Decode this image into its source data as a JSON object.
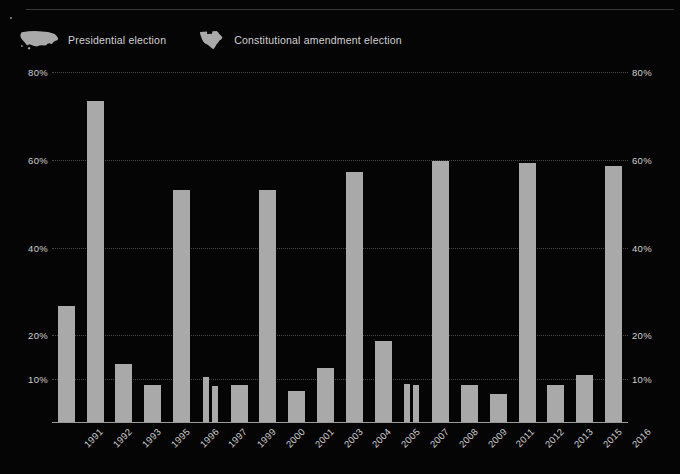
{
  "legend": {
    "items": [
      {
        "label": "Presidential election",
        "icon": "usa-map-icon",
        "color": "#a9a9a9"
      },
      {
        "label": "Constitutional amendment election",
        "icon": "texas-map-icon",
        "color": "#a9a9a9"
      }
    ]
  },
  "axis": {
    "y_ticks": [
      "80%",
      "60%",
      "40%",
      "20%",
      "10%"
    ],
    "y_tick_values": [
      80,
      60,
      40,
      20,
      10
    ],
    "y_axis_right_ticks": [
      "80%",
      "60%",
      "40%",
      "20%",
      "10%"
    ]
  },
  "colors": {
    "background": "#050505",
    "bar": "#a9a9a9",
    "gridline": "#4a4a4a",
    "baseline": "#9a9a9a",
    "text": "#cfcfcf",
    "rule": "#3a3a3a"
  },
  "chart_data": {
    "type": "bar",
    "title": "",
    "subtitle": "",
    "xlabel": "",
    "ylabel": "",
    "ylim": [
      0,
      80
    ],
    "grid": true,
    "legend_position": "top-left",
    "categories": [
      "1991",
      "1992",
      "1993",
      "1995",
      "1996",
      "1997",
      "1999",
      "2000",
      "2001",
      "2003",
      "2004",
      "2005",
      "2007",
      "2008",
      "2009",
      "2011",
      "2012",
      "2013",
      "2015",
      "2016"
    ],
    "bars": [
      {
        "category": "1991",
        "values": [
          26.6
        ],
        "type": "amendment"
      },
      {
        "category": "1992",
        "values": [
          73.4
        ],
        "type": "presidential"
      },
      {
        "category": "1993",
        "values": [
          13.4
        ],
        "type": "amendment"
      },
      {
        "category": "1995",
        "values": [
          8.6
        ],
        "type": "amendment"
      },
      {
        "category": "1996",
        "values": [
          53.0
        ],
        "type": "presidential"
      },
      {
        "category": "1997",
        "values": [
          10.5,
          8.5
        ],
        "type": "amendment"
      },
      {
        "category": "1999",
        "values": [
          8.6
        ],
        "type": "amendment"
      },
      {
        "category": "2000",
        "values": [
          53.0
        ],
        "type": "presidential"
      },
      {
        "category": "2001",
        "values": [
          7.3
        ],
        "type": "amendment"
      },
      {
        "category": "2003",
        "values": [
          12.5
        ],
        "type": "amendment"
      },
      {
        "category": "2004",
        "values": [
          57.2
        ],
        "type": "presidential"
      },
      {
        "category": "2005",
        "values": [
          18.7
        ],
        "type": "amendment"
      },
      {
        "category": "2007",
        "values": [
          8.9,
          8.6
        ],
        "type": "amendment"
      },
      {
        "category": "2008",
        "values": [
          59.8
        ],
        "type": "presidential"
      },
      {
        "category": "2009",
        "values": [
          8.6
        ],
        "type": "amendment"
      },
      {
        "category": "2011",
        "values": [
          6.5
        ],
        "type": "amendment"
      },
      {
        "category": "2012",
        "values": [
          59.2
        ],
        "type": "presidential"
      },
      {
        "category": "2013",
        "values": [
          8.7
        ],
        "type": "amendment"
      },
      {
        "category": "2015",
        "values": [
          11.0
        ],
        "type": "amendment"
      },
      {
        "category": "2016",
        "values": [
          58.5
        ],
        "type": "presidential"
      }
    ],
    "values": [
      26.6,
      73.4,
      13.4,
      8.6,
      53.0,
      10.5,
      8.6,
      53.0,
      7.3,
      12.5,
      57.2,
      18.7,
      8.9,
      59.8,
      8.6,
      6.5,
      59.2,
      8.7,
      11.0,
      58.5
    ]
  }
}
